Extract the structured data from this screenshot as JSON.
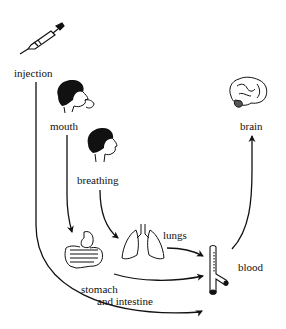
{
  "diagram": {
    "labels": {
      "injection": "injection",
      "mouth": "mouth",
      "breathing": "breathing",
      "lungs": "lungs",
      "blood": "blood",
      "brain": "brain",
      "stomach_line1": "stomach",
      "stomach_line2": "and intestine"
    },
    "icons": {
      "syringe": "syringe-icon",
      "head_mouth": "child-head-eating-icon",
      "head_breathing": "child-head-breathing-icon",
      "lungs": "lungs-icon",
      "stomach": "stomach-intestine-icon",
      "blood_vessel": "blood-vessel-icon",
      "brain": "brain-icon"
    },
    "edges": [
      {
        "from": "injection",
        "to": "blood"
      },
      {
        "from": "mouth",
        "to": "stomach and intestine"
      },
      {
        "from": "breathing",
        "to": "lungs"
      },
      {
        "from": "lungs",
        "to": "blood"
      },
      {
        "from": "stomach and intestine",
        "to": "blood"
      },
      {
        "from": "blood",
        "to": "brain"
      }
    ],
    "colors": {
      "ink": "#111111",
      "background": "#ffffff"
    }
  }
}
